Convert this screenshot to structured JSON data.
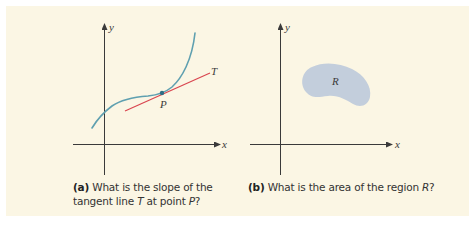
{
  "colors": {
    "background": "#fbf6e4",
    "axis": "#3a3a3a",
    "curve": "#5fa0b0",
    "tangent": "#d9454f",
    "point": "#2f6f86",
    "region_fill": "#c3cedc"
  },
  "figure_a": {
    "y_label": "y",
    "x_label": "x",
    "tangent_label": "T",
    "point_label": "P",
    "caption": {
      "tag": "(a)",
      "line1": " What is the slope of the",
      "line2_prefix": "tangent line ",
      "line2_var_t": "T",
      "line2_mid": " at point ",
      "line2_var_p": "P",
      "line2_suffix": "?"
    }
  },
  "figure_b": {
    "y_label": "y",
    "x_label": "x",
    "region_label": "R",
    "caption": {
      "tag": "(b)",
      "text_prefix": " What is the area of the region ",
      "text_var": "R",
      "text_suffix": "?"
    }
  }
}
